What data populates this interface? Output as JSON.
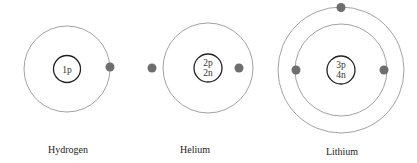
{
  "colors": {
    "orbit": "#8a8a8a",
    "nucleus": "#222222",
    "electron": "#6e6e6e"
  },
  "atoms": [
    {
      "name": "Hydrogen",
      "nucleus_line1": "1p",
      "nucleus_line2": "",
      "electrons": 1,
      "shells": [
        1
      ]
    },
    {
      "name": "Helium",
      "nucleus_line1": "2p",
      "nucleus_line2": "2n",
      "electrons": 2,
      "shells": [
        2
      ]
    },
    {
      "name": "Lithium",
      "nucleus_line1": "3p",
      "nucleus_line2": "4n",
      "electrons": 3,
      "shells": [
        2,
        1
      ]
    }
  ]
}
